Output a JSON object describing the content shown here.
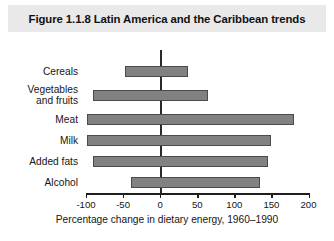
{
  "figure": {
    "title": "Figure 1.1.8  Latin America and the Caribbean trends"
  },
  "chart_data": {
    "type": "bar",
    "orientation": "horizontal",
    "title": "Figure 1.1.8  Latin America and the Caribbean trends",
    "xlabel": "Percentage change in dietary energy, 1960–1990",
    "ylabel": "",
    "xlim": [
      -100,
      200
    ],
    "xticks": [
      -100,
      -50,
      0,
      50,
      100,
      150,
      200
    ],
    "xtick_labels": [
      "-100",
      "-50",
      "0",
      "50",
      "100",
      "150",
      "200"
    ],
    "grid": false,
    "legend": null,
    "zero_line": 0,
    "categories": [
      "Cereals",
      "Vegetables\nand fruits",
      "Meat",
      "Milk",
      "Added fats",
      "Alcohol"
    ],
    "bars": [
      {
        "label": "Cereals",
        "start": -48,
        "end": 38
      },
      {
        "label": "Vegetables\nand fruits",
        "start": -91,
        "end": 64
      },
      {
        "label": "Meat",
        "start": -98,
        "end": 180
      },
      {
        "label": "Milk",
        "start": -98,
        "end": 149
      },
      {
        "label": "Added fats",
        "start": -91,
        "end": 146
      },
      {
        "label": "Alcohol",
        "start": -39,
        "end": 134
      }
    ],
    "colors": {
      "bar_fill": "#818181",
      "bar_border": "#4b4b4b",
      "axis": "#1f1f1f",
      "title_bar_bg": "#e9e9e9",
      "text": "#161616"
    }
  }
}
